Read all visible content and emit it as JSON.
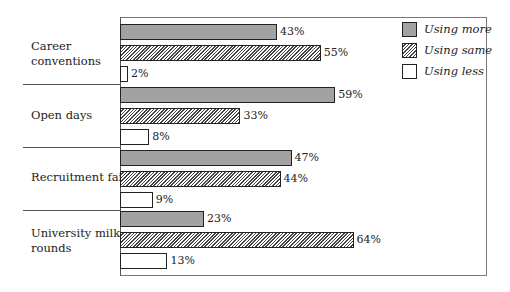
{
  "chart_data": {
    "type": "bar",
    "orientation": "horizontal",
    "title": "",
    "xlabel": "",
    "ylabel": "",
    "categories": [
      "Career conventions",
      "Open days",
      "Recruitment fairs",
      "University milk rounds"
    ],
    "series": [
      {
        "name": "Using more",
        "values": [
          43,
          59,
          47,
          23
        ],
        "labels": [
          "43%",
          "59%",
          "47%",
          "23%"
        ],
        "pattern": "dotted-grey"
      },
      {
        "name": "Using same",
        "values": [
          55,
          33,
          44,
          64
        ],
        "labels": [
          "55%",
          "33%",
          "44%",
          "64%"
        ],
        "pattern": "diagonal-hatch"
      },
      {
        "name": "Using less",
        "values": [
          2,
          8,
          9,
          13
        ],
        "labels": [
          "2%",
          "8%",
          "9%",
          "13%"
        ],
        "pattern": "white"
      }
    ],
    "xlim": [
      0,
      100
    ],
    "grid": false,
    "legend_position": "top-right",
    "unit": "%"
  },
  "categories_display": [
    [
      "Career",
      "conventions"
    ],
    [
      "Open days"
    ],
    [
      "Recruitment fairs"
    ],
    [
      "University milk",
      "rounds"
    ]
  ],
  "legend": [
    {
      "label": "Using more"
    },
    {
      "label": "Using same"
    },
    {
      "label": "Using less"
    }
  ]
}
